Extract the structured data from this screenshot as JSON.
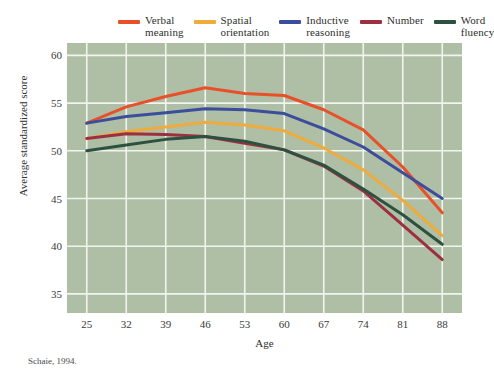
{
  "figure": {
    "source_note": "Schaie, 1994."
  },
  "chart_data": {
    "type": "line",
    "title": "",
    "xlabel": "Age",
    "ylabel": "Average standardized score",
    "x": [
      25,
      32,
      39,
      46,
      53,
      60,
      67,
      74,
      81,
      88
    ],
    "xtick_labels": [
      "25",
      "32",
      "39",
      "46",
      "53",
      "60",
      "67",
      "74",
      "81",
      "88"
    ],
    "ytick_labels": [
      "60",
      "55",
      "50",
      "45",
      "40",
      "35"
    ],
    "yticks": [
      60,
      55,
      50,
      45,
      40,
      35
    ],
    "xlim": [
      21.5,
      91.5
    ],
    "ylim": [
      33.0,
      61.3
    ],
    "grid": true,
    "legend_position": "above-plot",
    "plot_background": "#aebfa5",
    "grid_color": "#f2f4ef",
    "series": [
      {
        "name": "Verbal meaning",
        "label_line1": "Verbal",
        "label_line2": "meaning",
        "color": "#e8502a",
        "values": [
          52.9,
          54.6,
          55.7,
          56.6,
          56.0,
          55.8,
          54.3,
          52.2,
          48.3,
          43.5
        ]
      },
      {
        "name": "Spatial orientation",
        "label_line1": "Spatial",
        "label_line2": "orientation",
        "color": "#efab3c",
        "values": [
          51.3,
          52.0,
          52.5,
          53.0,
          52.7,
          52.1,
          50.3,
          48.0,
          44.8,
          41.1
        ]
      },
      {
        "name": "Inductive reasoning",
        "label_line1": "Inductive",
        "label_line2": "reasoning",
        "color": "#3b4d9c",
        "values": [
          52.9,
          53.6,
          54.0,
          54.4,
          54.3,
          53.9,
          52.3,
          50.4,
          47.7,
          45.0
        ]
      },
      {
        "name": "Number",
        "label_line1": "Number",
        "label_line2": "",
        "color": "#9c3040",
        "values": [
          51.3,
          51.8,
          51.7,
          51.5,
          50.8,
          50.1,
          48.4,
          45.8,
          42.2,
          38.6
        ]
      },
      {
        "name": "Word fluency",
        "label_line1": "Word",
        "label_line2": "fluency",
        "color": "#2d5141",
        "values": [
          50.0,
          50.6,
          51.2,
          51.5,
          51.0,
          50.1,
          48.5,
          46.0,
          43.3,
          40.2
        ]
      }
    ]
  }
}
